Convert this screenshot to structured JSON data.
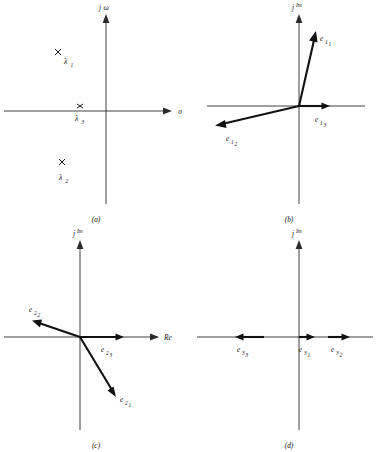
{
  "figure": {
    "type": "complex-plane-eigen-diagram",
    "panel_count": 4,
    "stroke_color": "#111111",
    "axis_color": "#2b2b2b",
    "background": "#ffffff"
  },
  "panels": [
    {
      "id": "a",
      "caption": "(a)",
      "plane": "s-plane",
      "axis_horizontal_label": "σ",
      "axis_vertical_label": "j",
      "axis_vertical_sub": "ω",
      "content_kind": "poles",
      "poles": [
        {
          "name": "lambda-1",
          "marker": "×",
          "label": "λ",
          "sub": "1",
          "x": 58,
          "y": 52,
          "label_x": 64,
          "label_y": 64
        },
        {
          "name": "lambda-3",
          "marker": "×",
          "label": "λ",
          "sub": "3",
          "x": 80,
          "y": 106,
          "label_x": 76,
          "label_y": 119
        },
        {
          "name": "lambda-2",
          "marker": "×",
          "label": "λ",
          "sub": "2",
          "x": 62,
          "y": 162,
          "label_x": 60,
          "label_y": 178
        }
      ]
    },
    {
      "id": "b",
      "caption": "(b)",
      "plane": "eigenvector-plane",
      "axis_horizontal_label": "",
      "axis_vertical_label": "j",
      "axis_vertical_sup": "Im",
      "content_kind": "vectors",
      "vectors": [
        {
          "name": "e-1-1",
          "label": "e",
          "sub": "1",
          "sub2": "1",
          "tip_x": 123,
          "tip_y": 34,
          "label_x": 128,
          "label_y": 40
        },
        {
          "name": "e-1-2",
          "label": "e",
          "sub": "1",
          "sub2": "2",
          "tip_x": 22,
          "tip_y": 125,
          "label_x": 38,
          "label_y": 141
        },
        {
          "name": "e-1-3",
          "label": "e",
          "sub": "1",
          "sub2": "3",
          "tip_x": 137,
          "tip_y": 106,
          "label_x": 126,
          "label_y": 122
        }
      ]
    },
    {
      "id": "c",
      "caption": "(c)",
      "plane": "eigenvector-plane",
      "axis_horizontal_label": "Re",
      "axis_vertical_label": "j",
      "axis_vertical_sup": "Im",
      "content_kind": "vectors",
      "vectors": [
        {
          "name": "e-2-2",
          "label": "e",
          "sub": "2",
          "sub2": "2",
          "tip_x": 32,
          "tip_y": 90,
          "label_x": 33,
          "label_y": 84
        },
        {
          "name": "e-2-3",
          "label": "e",
          "sub": "2",
          "sub2": "3",
          "tip_x": 124,
          "tip_y": 111,
          "label_x": 105,
          "label_y": 126
        },
        {
          "name": "e-2-1",
          "label": "e",
          "sub": "2",
          "sub2": "1",
          "tip_x": 116,
          "tip_y": 170,
          "label_x": 122,
          "label_y": 174
        }
      ]
    },
    {
      "id": "d",
      "caption": "(d)",
      "plane": "eigenvector-plane",
      "axis_horizontal_label": "",
      "axis_vertical_label": "j",
      "axis_vertical_sup": "Im",
      "content_kind": "vectors",
      "vectors": [
        {
          "name": "e-3-3",
          "label": "e",
          "sub": "3",
          "sub2": "3",
          "tip_x": 42,
          "tip_y": 111,
          "label_x": 48,
          "label_y": 126
        },
        {
          "name": "e-3-1",
          "label": "e",
          "sub": "3",
          "sub2": "1",
          "tip_x": 122,
          "tip_y": 111,
          "label_x": 110,
          "label_y": 126
        },
        {
          "name": "e-3-2",
          "label": "e",
          "sub": "3",
          "sub2": "2",
          "tip_x": 157,
          "tip_y": 111,
          "label_x": 142,
          "label_y": 126
        }
      ]
    }
  ],
  "geometry": {
    "origin_x": 106,
    "origin_y": 111,
    "h_axis_x1": 4,
    "h_axis_x2": 172,
    "v_axis_y1": 14,
    "v_axis_y2": 204,
    "caption_y": 222,
    "caption_x": 96
  }
}
